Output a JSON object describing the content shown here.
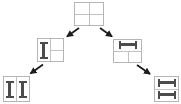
{
  "canvas": {
    "width": 181,
    "height": 104
  },
  "diagram": {
    "colors": {
      "background": "#ffffff",
      "box_border": "#b5b5b5",
      "divider": "#c2c2c2",
      "glyph": "#4c4c4c",
      "arrow": "#1c1c1c"
    },
    "nodes": [
      {
        "id": "root",
        "icon": "four-pane-grid",
        "description": "window split into four panes in a 2x2 grid"
      },
      {
        "id": "left-branch",
        "icon": "vertical-ibeam-icon",
        "description": "left pane holds a vertical I-beam splitter; right pane split into two stacked cells"
      },
      {
        "id": "right-branch",
        "icon": "horizontal-ibeam-icon",
        "description": "top pane holds a horizontal I-beam splitter; bottom pane split into two side-by-side cells"
      },
      {
        "id": "left-leaf",
        "icon": "vertical-ibeam-icon",
        "description": "two side-by-side cells, each holding a vertical I-beam splitter"
      },
      {
        "id": "right-leaf",
        "icon": "horizontal-ibeam-icon",
        "description": "two stacked cells, each holding a horizontal I-beam splitter"
      }
    ],
    "edges": [
      {
        "from": "root",
        "to": "left-branch",
        "direction": "down-left"
      },
      {
        "from": "root",
        "to": "right-branch",
        "direction": "down-right"
      },
      {
        "from": "left-branch",
        "to": "left-leaf",
        "direction": "down-left"
      },
      {
        "from": "right-branch",
        "to": "right-leaf",
        "direction": "down-right"
      }
    ]
  }
}
